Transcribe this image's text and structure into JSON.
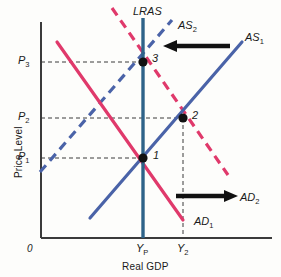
{
  "figure": {
    "type": "economics-as-ad-diagram",
    "background_color": "#fdfdfb"
  },
  "axes": {
    "x_title": "Real GDP",
    "y_title": "Price Level",
    "origin_label": "0",
    "axis_color": "#3b3b3b",
    "x_ticks": [
      {
        "id": "yp",
        "label": "Y",
        "sub": "P",
        "x": 143
      },
      {
        "id": "y2",
        "label": "Y",
        "sub": "2",
        "x": 183
      }
    ],
    "y_ticks": [
      {
        "id": "p3",
        "label": "P",
        "sub": "3",
        "y": 62
      },
      {
        "id": "p2",
        "label": "P",
        "sub": "2",
        "y": 118
      },
      {
        "id": "p1",
        "label": "P",
        "sub": "1",
        "y": 158
      }
    ]
  },
  "curves": [
    {
      "id": "lras",
      "label": "LRAS",
      "sub": "",
      "color": "#2e6389",
      "style": "solid",
      "width": 3,
      "points": "143,18 143,238"
    },
    {
      "id": "as1",
      "label": "AS",
      "sub": "1",
      "color": "#4a63a8",
      "style": "solid",
      "width": 3,
      "points": "90,218 242,42"
    },
    {
      "id": "as2",
      "label": "AS",
      "sub": "2",
      "color": "#4a63a8",
      "style": "dashed",
      "width": 3,
      "points": "40,172 172,20"
    },
    {
      "id": "ad1",
      "label": "AD",
      "sub": "1",
      "color": "#e0396b",
      "style": "solid",
      "width": 3,
      "points": "57,42 183,220"
    },
    {
      "id": "ad2",
      "label": "AD",
      "sub": "2",
      "color": "#e0396b",
      "style": "dashed",
      "width": 3,
      "points": "112,8 228,175"
    }
  ],
  "equilibrium_points": [
    {
      "id": "point-1",
      "label": "1",
      "x": 143,
      "y": 158
    },
    {
      "id": "point-2",
      "label": "2",
      "x": 183,
      "y": 118
    },
    {
      "id": "point-3",
      "label": "3",
      "x": 143,
      "y": 62
    }
  ],
  "shift_arrows": [
    {
      "id": "as-shift-arrow",
      "direction": "left",
      "x1": 228,
      "y1": 46,
      "x2": 168,
      "y2": 46,
      "color": "#111111"
    },
    {
      "id": "ad-shift-arrow",
      "direction": "right",
      "x1": 178,
      "y1": 196,
      "x2": 233,
      "y2": 196,
      "color": "#111111"
    }
  ],
  "guide_lines": {
    "color": "#3b3b3b",
    "style": "dashed",
    "items": [
      {
        "id": "p3-guide",
        "from": [
          41,
          62
        ],
        "to": [
          143,
          62
        ]
      },
      {
        "id": "p2-guide",
        "from": [
          41,
          118
        ],
        "to": [
          183,
          118
        ]
      },
      {
        "id": "p1-guide",
        "from": [
          41,
          158
        ],
        "to": [
          143,
          158
        ]
      },
      {
        "id": "y2-guide",
        "from": [
          183,
          118
        ],
        "to": [
          183,
          238
        ]
      }
    ]
  },
  "labels": {
    "lras": "LRAS",
    "as1_main": "AS",
    "as1_sub": "1",
    "as2_main": "AS",
    "as2_sub": "2",
    "ad1_main": "AD",
    "ad1_sub": "1",
    "ad2_main": "AD",
    "ad2_sub": "2",
    "p3_main": "P",
    "p3_sub": "3",
    "p2_main": "P",
    "p2_sub": "2",
    "p1_main": "P",
    "p1_sub": "1",
    "yp_main": "Y",
    "yp_sub": "P",
    "y2_main": "Y",
    "y2_sub": "2",
    "point1": "1",
    "point2": "2",
    "point3": "3"
  }
}
